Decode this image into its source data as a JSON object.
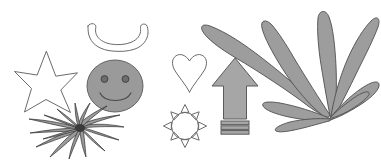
{
  "canvas": {
    "width": 381,
    "height": 163,
    "background_color": "#ffffff",
    "title": "Assorted clipart shapes"
  },
  "palette": {
    "fill_gray": "#9a9a9a",
    "fill_arrow_gray": "#a6a6a6",
    "fill_leaf_gray": "#9d9d9d",
    "outline_light": "#6b6b6b",
    "outline_dark": "#2e2e2e",
    "eye_gray": "#6d6d6d",
    "background": "#ffffff"
  },
  "shapes": [
    {
      "id": "crescent",
      "icon_name": "crescent-bowl-icon",
      "label": "Crescent bowl",
      "style": "outline",
      "fill": "none",
      "stroke": "#6b6b6b",
      "bbox": {
        "x": 86,
        "y": 24,
        "width": 63,
        "height": 28
      }
    },
    {
      "id": "star",
      "icon_name": "five-point-star-icon",
      "label": "Five-pointed star",
      "style": "outline",
      "fill": "none",
      "stroke": "#6b6b6b",
      "points": 5,
      "bbox": {
        "x": 14,
        "y": 51,
        "width": 64,
        "height": 62
      }
    },
    {
      "id": "smiley",
      "icon_name": "smiley-face-icon",
      "label": "Smiley face",
      "style": "filled",
      "fill": "#9a9a9a",
      "stroke": "#585858",
      "features": [
        "left-eye",
        "right-eye",
        "smile"
      ],
      "bbox": {
        "x": 87,
        "y": 60,
        "width": 56,
        "height": 52
      }
    },
    {
      "id": "grass-burst",
      "icon_name": "grass-burst-icon",
      "label": "Radiating grass blades",
      "style": "filled",
      "fill": "#9a9a9a",
      "stroke": "#2e2e2e",
      "blade_count": 16,
      "bbox": {
        "x": 28,
        "y": 112,
        "width": 100,
        "height": 48
      }
    },
    {
      "id": "heart",
      "icon_name": "heart-icon",
      "label": "Heart",
      "style": "outline",
      "fill": "none",
      "stroke": "#6b6b6b",
      "bbox": {
        "x": 172,
        "y": 54,
        "width": 35,
        "height": 38
      }
    },
    {
      "id": "sun",
      "icon_name": "sun-icon",
      "label": "Sun with rays",
      "style": "outline",
      "fill": "none",
      "stroke": "#6b6b6b",
      "ray_count": 8,
      "bbox": {
        "x": 163,
        "y": 104,
        "width": 44,
        "height": 44
      }
    },
    {
      "id": "arrow-up",
      "icon_name": "arrow-up-icon",
      "label": "Upward arrow",
      "style": "filled",
      "fill": "#a6a6a6",
      "stroke": "#5a5a5a",
      "stripe_count": 3,
      "bbox": {
        "x": 212,
        "y": 58,
        "width": 46,
        "height": 76
      }
    },
    {
      "id": "plant",
      "icon_name": "leafy-plant-icon",
      "label": "Leafy plant cluster",
      "style": "filled",
      "fill": "#9d9d9d",
      "stroke": "#4f4f4f",
      "leaf_count": 8,
      "bbox": {
        "x": 200,
        "y": 8,
        "width": 180,
        "height": 112
      }
    }
  ]
}
